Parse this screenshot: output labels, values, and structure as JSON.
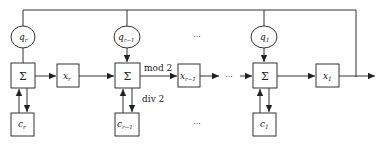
{
  "diagram": {
    "type": "block-diagram",
    "colors": {
      "stroke": "#333333",
      "text": "#222222",
      "background": "#ffffff"
    },
    "stages": [
      {
        "q": {
          "base": "q",
          "sub": "r"
        },
        "sum": "Σ",
        "c": {
          "base": "c",
          "sub": "r"
        },
        "x": {
          "base": "x",
          "sub": "r"
        }
      },
      {
        "q": {
          "base": "q",
          "sub": "r−1"
        },
        "sum": "Σ",
        "c": {
          "base": "c",
          "sub": "r−1"
        },
        "x": {
          "base": "x",
          "sub": "r−1"
        }
      },
      {
        "q": {
          "base": "q",
          "sub": "1"
        },
        "sum": "Σ",
        "c": {
          "base": "c",
          "sub": "1"
        },
        "x": {
          "base": "x",
          "sub": "1"
        }
      }
    ],
    "edge_labels": {
      "mod": "mod 2",
      "div": "div 2"
    },
    "ellipsis": "···"
  }
}
